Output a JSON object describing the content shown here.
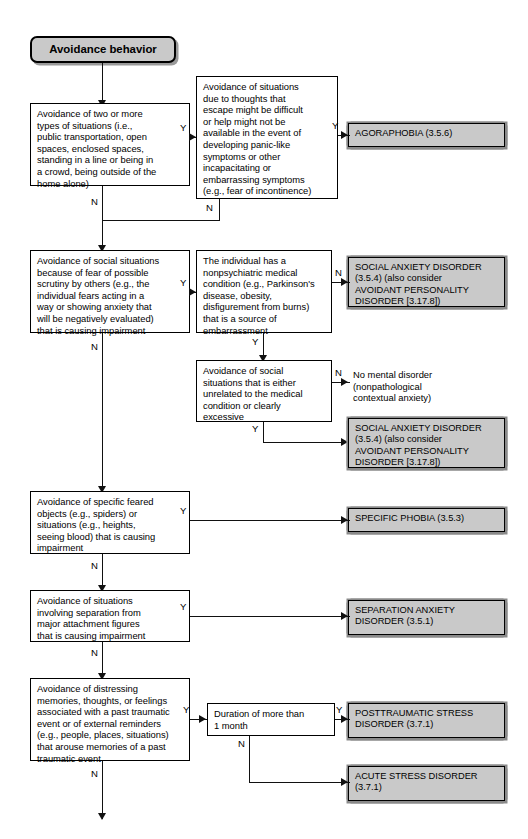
{
  "diagram": {
    "title": "Avoidance behavior",
    "edge_labels": {
      "yes": "Y",
      "no": "N"
    }
  },
  "nodes": {
    "start": "Avoidance behavior",
    "q_agoraphobia_situations": "Avoidance of two or more\ntypes of situations (i.e.,\npublic transportation, open\nspaces, enclosed spaces,\nstanding in a line or being in\na crowd, being outside of the\nhome alone)",
    "q_agoraphobia_thoughts": "Avoidance of situations\ndue to thoughts that\nescape might be difficult\nor help might not be\navailable in the event of\ndeveloping panic-like\nsymptoms or other\nincapacitating or\nembarrassing symptoms\n(e.g., fear of incontinence)",
    "dx_agoraphobia": "AGORAPHOBIA (3.5.6)",
    "q_social_scrutiny": "Avoidance of social situations\nbecause of fear of possible\nscrutiny by others (e.g., the\nindividual fears acting in a\nway or showing anxiety that\nwill be negatively evaluated)\nthat is causing impairment",
    "q_medical_condition": "The individual has a\nnonpsychiatric medical\ncondition (e.g., Parkinson's\ndisease, obesity,\ndisfigurement from burns)\nthat is a source of\nembarrassment",
    "dx_social_anxiety_1": "SOCIAL ANXIETY DISORDER\n(3.5.4) (also consider\nAVOIDANT PERSONALITY\nDISORDER [3.17.8])",
    "q_unrelated_or_excessive": "Avoidance of social\nsituations that is either\nunrelated to the medical\ncondition or clearly\nexcessive",
    "out_no_disorder": "No mental disorder\n(nonpathological\ncontextual anxiety)",
    "dx_social_anxiety_2": "SOCIAL ANXIETY DISORDER\n(3.5.4) (also consider\nAVOIDANT PERSONALITY\nDISORDER [3.17.8])",
    "q_specific_phobia": "Avoidance of specific feared\nobjects (e.g., spiders) or\nsituations (e.g., heights,\nseeing blood) that is causing\nimpairment",
    "dx_specific_phobia": "SPECIFIC PHOBIA (3.5.3)",
    "q_separation": "Avoidance of situations\ninvolving separation from\nmajor attachment figures\nthat is causing impairment",
    "dx_separation_anxiety": "SEPARATION ANXIETY\nDISORDER (3.5.1)",
    "q_trauma_avoidance": "Avoidance of distressing\nmemories, thoughts, or feelings\nassociated with a past traumatic\nevent or of external reminders\n(e.g., people, places, situations)\nthat arouse memories of a past\ntraumatic event",
    "q_duration": "Duration of more than\n1 month",
    "dx_ptsd": "POSTTRAUMATIC STRESS\nDISORDER (3.7.1)",
    "dx_acute_stress": "ACUTE STRESS DISORDER\n(3.7.1)"
  },
  "colors": {
    "shaded_fill": "#c9c9c9",
    "outline": "#000000",
    "shadow": "#8a8a8a",
    "page_background": "#ffffff"
  }
}
